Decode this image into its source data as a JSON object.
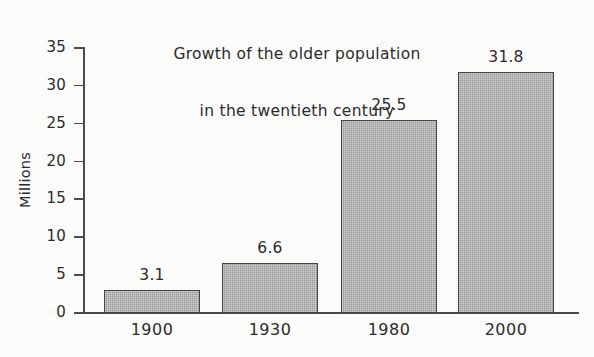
{
  "chart_data": {
    "type": "bar",
    "title": "Growth of the older population in the twentieth century",
    "title_lines": [
      "Growth of the older population",
      "in the twentieth century"
    ],
    "categories": [
      "1900",
      "1930",
      "1980",
      "2000"
    ],
    "values": [
      3.1,
      6.6,
      25.5,
      31.8
    ],
    "value_labels": [
      "3.1",
      "6.6",
      "25.5",
      "31.8"
    ],
    "xlabel": "",
    "ylabel": "Millions",
    "ylim": [
      0,
      35
    ],
    "yticks": [
      0,
      5,
      10,
      15,
      20,
      25,
      30,
      35
    ],
    "ytick_labels": [
      "0",
      "5",
      "10",
      "15",
      "20",
      "25",
      "30",
      "35"
    ],
    "grid": false,
    "legend": null,
    "bar_fill_color": "#a3a3a3",
    "bar_edge_color": "#434343",
    "axis_color": "#4a4a4a",
    "text_color": "#2b2b2b",
    "background_color": "#fbfbf9"
  }
}
